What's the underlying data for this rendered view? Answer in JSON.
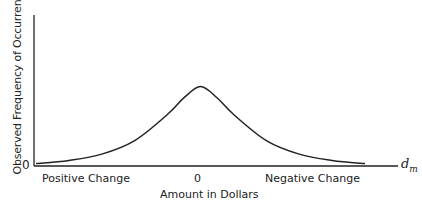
{
  "chart_data": {
    "type": "line",
    "title": "",
    "xlabel": "Amount in Dollars",
    "ylabel": "Observed Frequency of Occurrence",
    "x_axis_end_label": "d_m",
    "x_axis_end_label_base": "d",
    "x_axis_end_label_sub": "m",
    "y_tick_labels": [
      "0"
    ],
    "x_tick_labels": [
      "Positive Change",
      "0",
      "Negative Change"
    ],
    "grid": false,
    "legend": null,
    "series": [
      {
        "name": "frequency",
        "description": "Bell-shaped (peaked) frequency curve centered at 0, tails approaching zero on both sides",
        "x": [
          -1.0,
          -0.8,
          -0.6,
          -0.4,
          -0.2,
          -0.1,
          0.0,
          0.1,
          0.2,
          0.4,
          0.6,
          0.8,
          1.0
        ],
        "y": [
          0.03,
          0.07,
          0.15,
          0.32,
          0.65,
          0.86,
          1.0,
          0.86,
          0.65,
          0.32,
          0.15,
          0.07,
          0.03
        ]
      }
    ],
    "xlim": [
      -1.0,
      1.0
    ],
    "ylim": [
      0,
      1.9
    ]
  },
  "labels": {
    "y_axis": "Observed Frequency of Occurrence",
    "origin": "0",
    "left_category": "Positive Change",
    "center_tick": "0",
    "right_category": "Negative Change",
    "x_axis": "Amount in Dollars",
    "axis_end_base": "d",
    "axis_end_sub": "m"
  },
  "colors": {
    "ink": "#222222",
    "background": "#ffffff"
  }
}
